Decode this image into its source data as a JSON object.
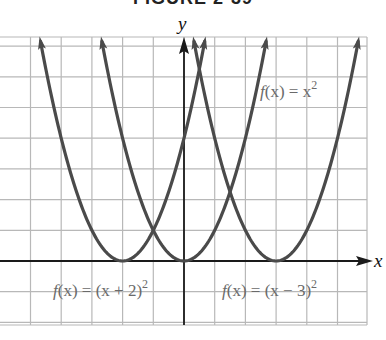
{
  "title": "FIGURE 2-39",
  "chart_data": {
    "type": "line",
    "title": "FIGURE 2-39",
    "xlabel": "x",
    "ylabel": "y",
    "xlim": [
      -6,
      6
    ],
    "ylim": [
      -2,
      7.3
    ],
    "grid": true,
    "grid_step": 1,
    "series": [
      {
        "name": "f(x) = (x + 2)^2",
        "label": "f(x) = (x + 2)²",
        "expression": "(x+2)^2",
        "vertex": [
          -2,
          0
        ],
        "x": [
          -4.7,
          -4,
          -3,
          -2,
          -1,
          0,
          0.7
        ],
        "values": [
          7.29,
          4,
          1,
          0,
          1,
          4,
          7.29
        ],
        "label_position": [
          -4.2,
          -1
        ]
      },
      {
        "name": "f(x) = x^2",
        "label": "f(x) = x²",
        "expression": "x^2",
        "vertex": [
          0,
          0
        ],
        "x": [
          -2.7,
          -2,
          -1,
          0,
          1,
          2,
          2.7
        ],
        "values": [
          7.29,
          4,
          1,
          0,
          1,
          4,
          7.29
        ],
        "label_position": [
          2.5,
          5.3
        ]
      },
      {
        "name": "f(x) = (x - 3)^2",
        "label": "f(x) = (x − 3)²",
        "expression": "(x-3)^2",
        "vertex": [
          3,
          0
        ],
        "x": [
          0.3,
          1,
          2,
          3,
          4,
          5,
          5.7
        ],
        "values": [
          7.29,
          4,
          1,
          0,
          1,
          4,
          7.29
        ],
        "label_position": [
          1.2,
          -1
        ]
      }
    ],
    "annotations": [
      "f(x) = x²",
      "f(x) = (x + 2)²",
      "f(x) = (x − 3)²"
    ]
  },
  "labels": {
    "x_axis": "x",
    "y_axis": "y",
    "f_x2": {
      "f": "f",
      "paren": "(x) = x",
      "sup": "2"
    },
    "f_plus2": {
      "f": "f",
      "paren": "(x) = (x + 2)",
      "sup": "2"
    },
    "f_minus3": {
      "f": "f",
      "paren": "(x) = (x − 3)",
      "sup": "2"
    }
  }
}
